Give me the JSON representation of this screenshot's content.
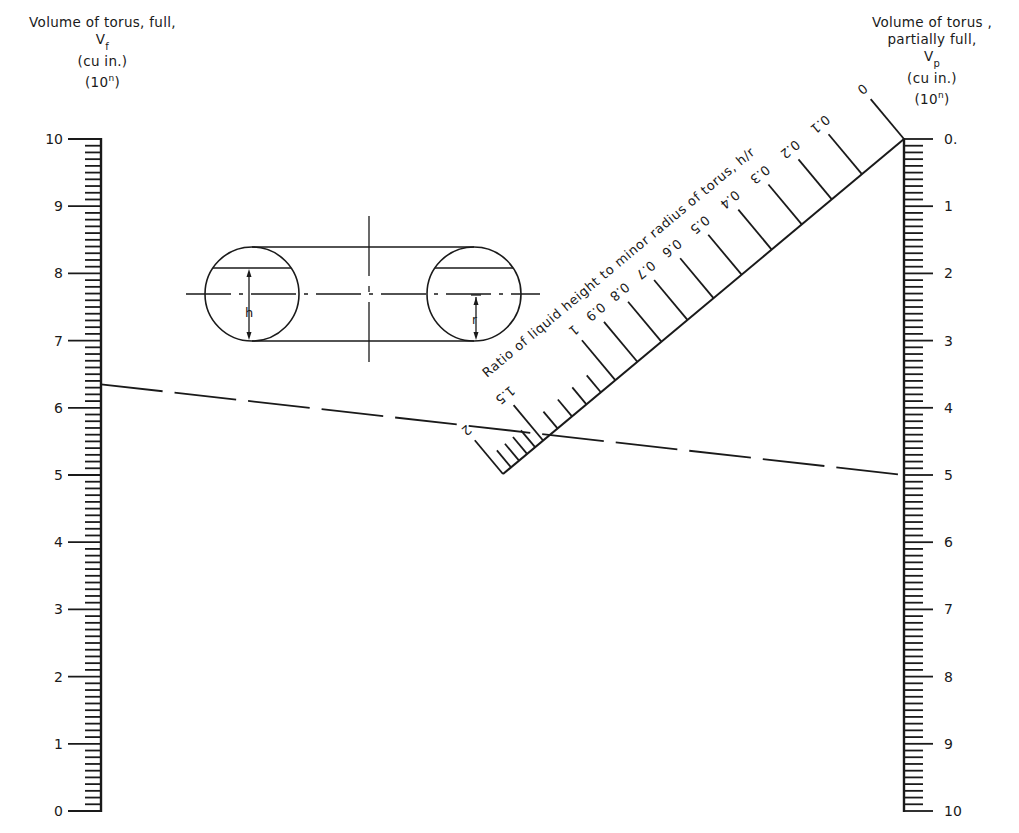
{
  "chart_data": {
    "type": "nomograph",
    "axes": [
      {
        "id": "left",
        "label_lines": [
          "Volume of torus, full,",
          "V",
          "(cu in.)",
          "(10^n)"
        ],
        "symbol": "V",
        "subscript": "f",
        "units": "(cu in.)",
        "exponent_note_base": "(10",
        "exponent_note_sup": "n",
        "exponent_note_close": ")",
        "title_line1": "Volume of torus, full,",
        "range": [
          0,
          10
        ],
        "direction": "bottom-to-top",
        "major_ticks": [
          0,
          1,
          2,
          3,
          4,
          5,
          6,
          7,
          8,
          9,
          10
        ],
        "major_tick_labels": [
          "0",
          "1",
          "2",
          "3",
          "4",
          "5",
          "6",
          "7",
          "8",
          "9",
          "10"
        ],
        "minor_divisions_per_unit": 10
      },
      {
        "id": "right",
        "symbol": "V",
        "subscript": "p",
        "units": "(cu in.)",
        "exponent_note_base": "(10",
        "exponent_note_sup": "n",
        "exponent_note_close": ")",
        "title_line1": "Volume of torus ,",
        "title_line2": "partially full,",
        "range": [
          0,
          10
        ],
        "direction": "top-to-bottom",
        "major_ticks": [
          0,
          1,
          2,
          3,
          4,
          5,
          6,
          7,
          8,
          9,
          10
        ],
        "major_tick_labels": [
          "0.",
          "1",
          "2",
          "3",
          "4",
          "5",
          "6",
          "7",
          "8",
          "9",
          "10"
        ],
        "minor_divisions_per_unit": 10
      },
      {
        "id": "diagonal",
        "label": "Ratio of liquid height to minor radius of torus, h/r",
        "labeled_ticks": [
          {
            "value": 0,
            "label": "0"
          },
          {
            "value": 0.1,
            "label": "0.1"
          },
          {
            "value": 0.2,
            "label": "0.2"
          },
          {
            "value": 0.3,
            "label": "0.3"
          },
          {
            "value": 0.4,
            "label": "0.4"
          },
          {
            "value": 0.5,
            "label": "0.5"
          },
          {
            "value": 0.6,
            "label": "0.6"
          },
          {
            "value": 0.7,
            "label": "0.7"
          },
          {
            "value": 0.8,
            "label": "0.8"
          },
          {
            "value": 0.9,
            "label": "0.9"
          },
          {
            "value": 1,
            "label": "1"
          },
          {
            "value": 1.5,
            "label": "1.5"
          },
          {
            "value": 2,
            "label": "2"
          }
        ],
        "unlabeled_ticks": [
          1.1,
          1.2,
          1.3,
          1.4,
          1.6,
          1.7,
          1.8,
          1.9
        ]
      }
    ],
    "example_isopleth": {
      "style": "dashed",
      "left_value": 6.35,
      "diagonal_value": 1.55,
      "right_value": 5.0
    },
    "inset_diagram": {
      "description": "Torus cross-section showing liquid height h and minor radius r",
      "labels": {
        "height": "h",
        "radius": "r"
      }
    }
  }
}
